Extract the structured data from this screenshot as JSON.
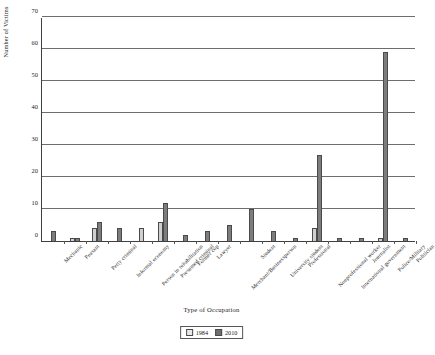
{
  "chart_data": {
    "type": "bar",
    "title": "",
    "xlabel": "Type of Occupation",
    "ylabel": "Number of Victims",
    "ylim": [
      0,
      70
    ],
    "yticks": [
      0,
      10,
      20,
      30,
      40,
      50,
      60,
      70
    ],
    "grid": true,
    "legend_position": "bottom-center",
    "categories": [
      "Mechanic",
      "Peasant",
      "Petty criminal",
      "Informal economy",
      "Person in rehabilitation",
      "Presumed criminal",
      "Former cop",
      "Lawyer",
      "Merchant/Businessperson",
      "Student",
      "University student",
      "Professional",
      "Nonprofessional worker",
      "International government",
      "Journalist",
      "Police/Military",
      "Politician"
    ],
    "series": [
      {
        "name": "1984",
        "color": "#cfcfcf",
        "values": [
          0,
          1,
          4,
          0,
          4,
          6,
          0,
          0,
          0,
          0,
          0,
          0,
          4,
          0,
          0,
          1,
          0
        ]
      },
      {
        "name": "2010",
        "color": "#7d7d7d",
        "values": [
          3,
          1,
          6,
          4,
          0,
          12,
          2,
          3,
          5,
          10,
          3,
          1,
          27,
          1,
          1,
          59,
          1
        ]
      }
    ]
  },
  "legend": {
    "entries": [
      {
        "label": "1984"
      },
      {
        "label": "2010"
      }
    ]
  }
}
